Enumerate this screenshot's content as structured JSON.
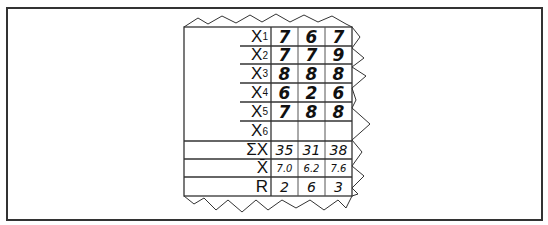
{
  "figure": {
    "row_labels": [
      {
        "base": "X",
        "sub": "1"
      },
      {
        "base": "X",
        "sub": "2"
      },
      {
        "base": "X",
        "sub": "3"
      },
      {
        "base": "X",
        "sub": "4"
      },
      {
        "base": "X",
        "sub": "5"
      },
      {
        "base": "X",
        "sub": "6"
      },
      {
        "base": "ΣX",
        "sub": ""
      },
      {
        "base": "X̄",
        "sub": ""
      },
      {
        "base": "R",
        "sub": ""
      }
    ],
    "columns": [
      {
        "x1": "7",
        "x2": "7",
        "x3": "8",
        "x4": "6",
        "x5": "7",
        "x6": "",
        "sum": "35",
        "mean": "7.0",
        "range": "2"
      },
      {
        "x1": "6",
        "x2": "7",
        "x3": "8",
        "x4": "2",
        "x5": "8",
        "x6": "",
        "sum": "31",
        "mean": "6.2",
        "range": "6"
      },
      {
        "x1": "7",
        "x2": "9",
        "x3": "8",
        "x4": "6",
        "x5": "8",
        "x6": "",
        "sum": "38",
        "mean": "7.6",
        "range": "3"
      }
    ]
  }
}
